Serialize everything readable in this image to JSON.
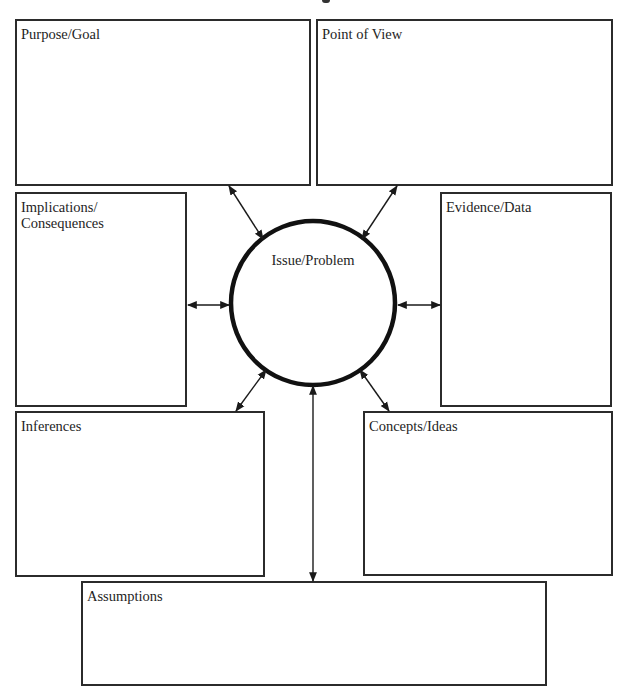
{
  "diagram": {
    "type": "graphic-organizer",
    "center": {
      "label": "Issue/Problem",
      "shape": "circle"
    },
    "boxes": [
      {
        "id": "purpose-goal",
        "label": "Purpose/Goal"
      },
      {
        "id": "point-of-view",
        "label": "Point of View"
      },
      {
        "id": "implications-consequences",
        "label": "Implications/\nConsequences"
      },
      {
        "id": "evidence-data",
        "label": "Evidence/Data"
      },
      {
        "id": "inferences",
        "label": "Inferences"
      },
      {
        "id": "concepts-ideas",
        "label": "Concepts/Ideas"
      },
      {
        "id": "assumptions",
        "label": "Assumptions"
      }
    ],
    "connections": [
      {
        "from": "Issue/Problem",
        "to": "Purpose/Goal",
        "bidirectional": true
      },
      {
        "from": "Issue/Problem",
        "to": "Point of View",
        "bidirectional": true
      },
      {
        "from": "Issue/Problem",
        "to": "Implications/Consequences",
        "bidirectional": true
      },
      {
        "from": "Issue/Problem",
        "to": "Evidence/Data",
        "bidirectional": true
      },
      {
        "from": "Issue/Problem",
        "to": "Inferences",
        "bidirectional": true
      },
      {
        "from": "Issue/Problem",
        "to": "Concepts/Ideas",
        "bidirectional": true
      },
      {
        "from": "Issue/Problem",
        "to": "Assumptions",
        "bidirectional": true
      }
    ],
    "colors": {
      "stroke": "#2b2b2b",
      "background": "#ffffff",
      "text": "#1e1e1e"
    }
  }
}
